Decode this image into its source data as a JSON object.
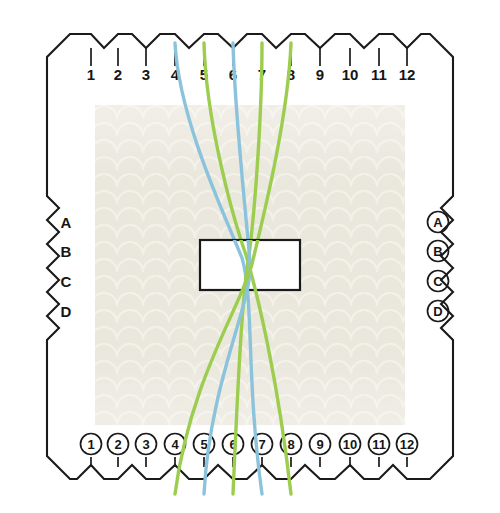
{
  "diagram": {
    "canvas": {
      "width": 500,
      "height": 513
    },
    "colors": {
      "green": "#9ccd4e",
      "blue": "#8cc3dc",
      "ink": "#1a1a1a",
      "fabric": "#e8e5da",
      "fabric_light": "#f2f0e8",
      "page": "#ffffff"
    },
    "fabric_panel": {
      "x": 95,
      "y": 105,
      "width": 310,
      "height": 320
    },
    "center_rect": {
      "x": 200,
      "y": 240,
      "width": 100,
      "height": 50
    }
  },
  "top_scale": {
    "name": "top-numbered-scale",
    "y_label": 80,
    "labels": [
      "1",
      "2",
      "3",
      "4",
      "5",
      "6",
      "7",
      "8",
      "9",
      "10",
      "11",
      "12"
    ],
    "x_positions": [
      91,
      118,
      146,
      175,
      204,
      233,
      262,
      291,
      320,
      350,
      379,
      407
    ]
  },
  "bottom_scale": {
    "name": "bottom-circled-scale",
    "y_label": 449,
    "labels": [
      "1",
      "2",
      "3",
      "4",
      "5",
      "6",
      "7",
      "8",
      "9",
      "10",
      "11",
      "12"
    ],
    "x_positions": [
      91,
      118,
      146,
      175,
      204,
      233,
      262,
      291,
      320,
      350,
      379,
      407
    ]
  },
  "left_scale": {
    "name": "left-letter-scale",
    "x_label": 66,
    "labels": [
      "A",
      "B",
      "C",
      "D"
    ],
    "y_positions": [
      222,
      251,
      281,
      311
    ]
  },
  "right_scale": {
    "name": "right-circled-letter-scale",
    "x_label": 438,
    "labels": [
      "A",
      "B",
      "C",
      "D"
    ],
    "y_positions": [
      222,
      251,
      281,
      311
    ]
  },
  "chart_data": {
    "type": "line",
    "xlabel": "Dent / slot number",
    "ylabel": "Shaft row",
    "threads": [
      {
        "id": "thread-1",
        "color": "green",
        "top_slot": 5,
        "bottom_slot": 8,
        "top_x": 204,
        "bottom_x": 291,
        "path": "M204,43 C206,120 232,215 246,255 C258,296 278,380 291,494"
      },
      {
        "id": "thread-2",
        "color": "blue",
        "top_slot": 4,
        "bottom_slot": 7,
        "top_x": 175,
        "bottom_x": 262,
        "path": "M175,43 C179,120 226,218 242,258 C254,298 246,380 262,494"
      },
      {
        "id": "thread-3",
        "color": "green",
        "top_slot": 7,
        "bottom_slot": 6,
        "top_x": 262,
        "bottom_x": 233,
        "path": "M262,43 C262,120 254,222 248,262 C242,300 238,380 233,494"
      },
      {
        "id": "thread-4",
        "color": "blue",
        "top_slot": 6,
        "bottom_slot": 5,
        "top_x": 233,
        "bottom_x": 204,
        "path": "M233,43 C235,120 247,222 250,263 C253,302 210,380 204,494"
      },
      {
        "id": "thread-5",
        "color": "green",
        "top_slot": 8,
        "bottom_slot": 4,
        "top_x": 291,
        "bottom_x": 175,
        "path": "M291,43 C288,120 262,222 252,264 C242,304 190,380 175,494"
      }
    ]
  }
}
